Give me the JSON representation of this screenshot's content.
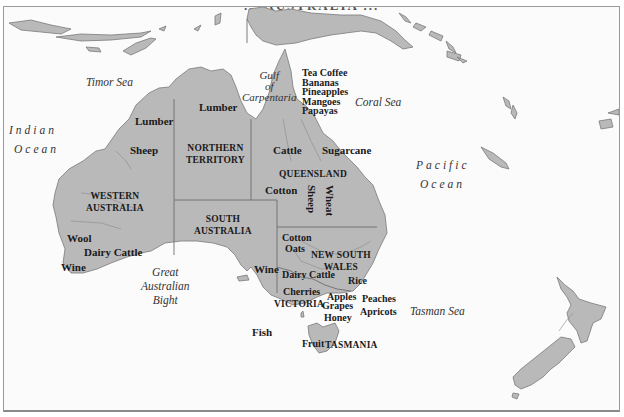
{
  "map": {
    "title_partial": "... AUSTRALIA ...",
    "colors": {
      "land": "#b9b9b9",
      "land_stroke": "#7a7a7a",
      "sea": "#fbfbfb",
      "border": "#6e6e6e",
      "text": "#1a1a1a"
    },
    "water_labels": {
      "timor_sea": "Timor Sea",
      "gulf_line1": "Gulf",
      "gulf_line2": "of",
      "gulf_line3": "Carpentaria",
      "coral_sea": "Coral Sea",
      "indian_ocean_line1": "Indian",
      "indian_ocean_line2": "Ocean",
      "pacific_ocean_line1": "Pacific",
      "pacific_ocean_line2": "Ocean",
      "bight_line1": "Great",
      "bight_line2": "Australian",
      "bight_line3": "Bight",
      "tasman_sea": "Tasman Sea"
    },
    "regions": {
      "western_australia_line1": "WESTERN",
      "western_australia_line2": "AUSTRALIA",
      "northern_territory_line1": "NORTHERN",
      "northern_territory_line2": "TERRITORY",
      "south_australia_line1": "SOUTH",
      "south_australia_line2": "AUSTRALIA",
      "queensland": "QUEENSLAND",
      "new_south_wales_line1": "NEW SOUTH",
      "new_south_wales_line2": "WALES",
      "victoria": "VICTORIA",
      "tasmania": "TASMANIA"
    },
    "products": {
      "lumber_wa": "Lumber",
      "lumber_nt": "Lumber",
      "sheep_wa": "Sheep",
      "wool": "Wool",
      "dairy_cattle_wa": "Dairy Cattle",
      "wine_wa": "Wine",
      "tropical_1": "Tea Coffee",
      "tropical_2": "Bananas",
      "tropical_3": "Pineapples",
      "tropical_4": "Mangoes",
      "tropical_5": "Papayas",
      "cattle_qld": "Cattle",
      "sugarcane": "Sugarcane",
      "cotton_qld": "Cotton",
      "sheep_qld": "Sheep",
      "wheat": "Wheat",
      "cotton_nsw": "Cotton",
      "oats": "Oats",
      "wine_sa": "Wine",
      "dairy_cattle_nsw": "Dairy Cattle",
      "rice": "Rice",
      "cherries": "Cherries",
      "apples": "Apples",
      "peaches": "Peaches",
      "grapes": "Grapes",
      "apricots": "Apricots",
      "honey": "Honey",
      "fish": "Fish",
      "fruit": "Fruit"
    }
  }
}
